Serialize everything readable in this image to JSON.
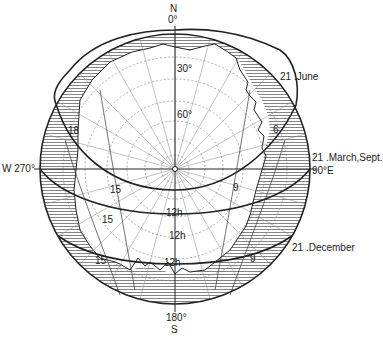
{
  "diagram": {
    "type": "sun-path stereographic projection",
    "center": {
      "x": 175,
      "y": 169
    },
    "radius": 135,
    "compass": {
      "north": {
        "letter": "N",
        "deg": "0°"
      },
      "south": {
        "letter": "S",
        "deg": "180°"
      },
      "west": "W 270°",
      "east": "90°E"
    },
    "altitude_labels": [
      "30°",
      "60°"
    ],
    "sun_paths": [
      {
        "name": "21 June",
        "label": "21 .June",
        "hours": {
          "morning": "6",
          "evening": "18"
        }
      },
      {
        "name": "21 March/Sept",
        "label": "21 .March,Sept.",
        "hours": {
          "morning": "9",
          "noon": "12h",
          "afternoon": "15"
        }
      },
      {
        "name": "21 December",
        "label": "21 .December",
        "hours": {
          "morning": "9",
          "noon": "12h",
          "afternoon": "15"
        }
      }
    ],
    "hour_labels": [
      {
        "text": "18",
        "x": 68,
        "y": 126
      },
      {
        "text": "6",
        "x": 273,
        "y": 125
      },
      {
        "text": "15",
        "x": 110,
        "y": 185
      },
      {
        "text": "9",
        "x": 233,
        "y": 183
      },
      {
        "text": "15",
        "x": 102,
        "y": 215
      },
      {
        "text": "12h",
        "x": 166,
        "y": 208
      },
      {
        "text": "12h",
        "x": 169,
        "y": 231
      },
      {
        "text": "15",
        "x": 95,
        "y": 256
      },
      {
        "text": "9",
        "x": 250,
        "y": 254
      },
      {
        "text": "12h",
        "x": 164,
        "y": 258
      }
    ],
    "colors": {
      "ink": "#222222",
      "hatch": "#555555",
      "background": "#ffffff"
    }
  }
}
